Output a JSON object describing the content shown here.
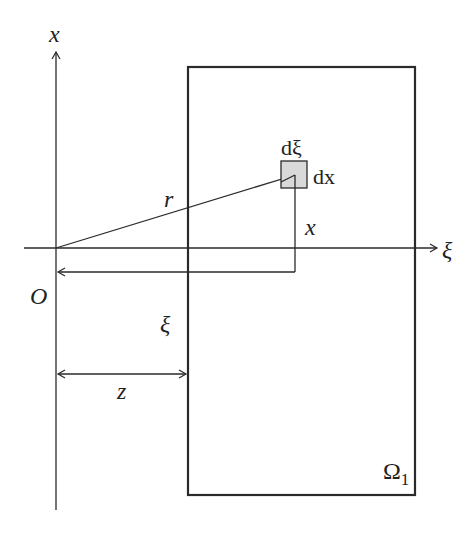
{
  "diagram": {
    "type": "geometry-figure",
    "axes": {
      "vertical_label": "x",
      "horizontal_label": "ξ",
      "origin_label": "O"
    },
    "region": {
      "label_main": "Ω",
      "label_sub": "1"
    },
    "element": {
      "width_label": "dξ",
      "height_label": "dx"
    },
    "distances": {
      "radius_label": "r",
      "height_label": "x",
      "xi_label": "ξ",
      "z_label": "z"
    },
    "colors": {
      "line": "#2a2a2a",
      "element_fill": "#d9d9d9",
      "background": "#ffffff"
    }
  }
}
